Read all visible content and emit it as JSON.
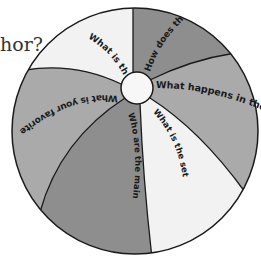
{
  "partial_text": "hor?",
  "ball": {
    "colors": {
      "light": "#f2f2f2",
      "medium": "#aaaaaa",
      "dark": "#8e8e8e",
      "outline": "#1a1a1a",
      "hub": "#f7f7f7"
    },
    "panels": [
      {
        "id": "top-left",
        "label": "What is the",
        "shade": "light"
      },
      {
        "id": "top-right",
        "label": "How does th",
        "shade": "dark"
      },
      {
        "id": "right",
        "label": "What happens in the",
        "shade": "medium"
      },
      {
        "id": "bottom-right",
        "label": "What is the setting?",
        "shade": "light"
      },
      {
        "id": "bottom",
        "label": "Who are the main characters?",
        "shade": "dark"
      },
      {
        "id": "left",
        "label": "What is your favorite pa",
        "shade": "medium"
      }
    ]
  }
}
